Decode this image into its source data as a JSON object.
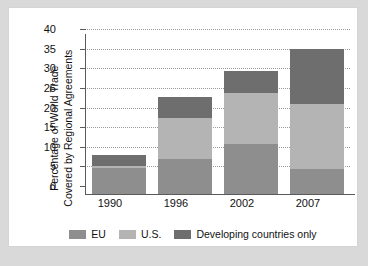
{
  "chart_data": {
    "type": "bar",
    "subtype": "stacked-bar",
    "title": "",
    "xlabel": "",
    "ylabel": "Percentage of World Trade Covered by Regional Agreements",
    "ylabel_lines": [
      "Percentage of World Trade",
      "Covered by Regional Agreements"
    ],
    "categories": [
      "1990",
      "1996",
      "2002",
      "2007"
    ],
    "series": [
      {
        "name": "EU",
        "color": "#8e8e8e",
        "values": [
          6.6,
          8.9,
          12.7,
          6.4
        ]
      },
      {
        "name": "U.S.",
        "color": "#b4b4b4",
        "values": [
          0.5,
          10.5,
          13.0,
          16.6
        ]
      },
      {
        "name": "Developing countries only",
        "color": "#6e6e6e",
        "values": [
          2.9,
          5.3,
          5.6,
          14.0
        ]
      }
    ],
    "totals": [
      10.0,
      24.7,
      31.3,
      37.0
    ],
    "ylim": [
      0,
      40
    ],
    "yticks": [
      0,
      5,
      10,
      15,
      20,
      25,
      30,
      35,
      40
    ],
    "ytick_labels": [
      "0",
      "5",
      "10",
      "15",
      "20",
      "25",
      "30",
      "35",
      "40"
    ],
    "grid": true,
    "grid_style": "dotted",
    "legend_position": "bottom",
    "legend": [
      "EU",
      "U.S.",
      "Developing countries only"
    ]
  },
  "colors": {
    "page_background": "#d9d9d9",
    "panel_background": "#ffffff",
    "axis": "#5a5a5a",
    "grid": "#9a9a9a",
    "text": "#111111"
  }
}
